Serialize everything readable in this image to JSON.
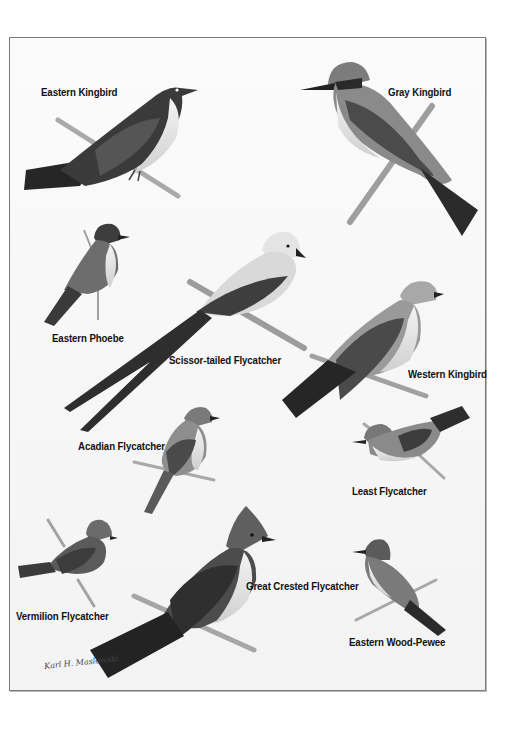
{
  "plate": {
    "type": "field-guide illustration plate",
    "subject": "flycatchers",
    "color_mode": "grayscale",
    "colors": {
      "background": "#ffffff",
      "frame": "#7a7a7a",
      "label_text": "#111111"
    }
  },
  "birds": [
    {
      "label": "Eastern Kingbird"
    },
    {
      "label": "Gray Kingbird"
    },
    {
      "label": "Eastern Phoebe"
    },
    {
      "label": "Scissor-tailed Flycatcher"
    },
    {
      "label": "Western Kingbird"
    },
    {
      "label": "Acadian Flycatcher"
    },
    {
      "label": "Least Flycatcher"
    },
    {
      "label": "Vermilion Flycatcher"
    },
    {
      "label": "Great Crested Flycatcher"
    },
    {
      "label": "Eastern Wood-Pewee"
    }
  ],
  "signature": {
    "text": "Karl H. Maslowski",
    "icon": "artist-signature"
  }
}
